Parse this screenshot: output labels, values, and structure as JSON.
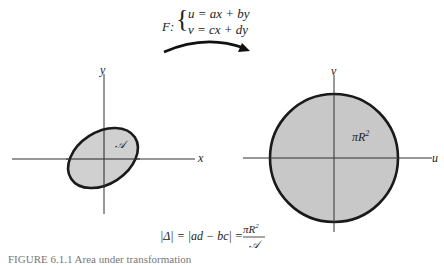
{
  "mapping": {
    "name": "F:",
    "eq_u": "u = ax + by",
    "eq_v": "v = cx + dy"
  },
  "left_plot": {
    "x_label": "x",
    "y_label": "y",
    "region_label": "𝒜"
  },
  "right_plot": {
    "u_label": "u",
    "v_label": "v",
    "region_label": "πR",
    "region_exp": "2"
  },
  "formula": {
    "lhs": "|Δ| = |ad − bc| =",
    "numerator": "πR",
    "numerator_exp": "2",
    "denominator": "𝒜"
  },
  "caption": "FIGURE 6.1.1 Area under transformation",
  "colors": {
    "fill": "#c8c8c8",
    "stroke": "#1a1a1a",
    "axis": "#333333"
  }
}
